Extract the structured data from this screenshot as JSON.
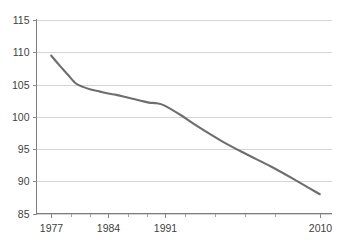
{
  "chart_data": {
    "type": "line",
    "title": "",
    "subtitle": "",
    "xlabel": "",
    "ylabel": "",
    "grid": "horizontal",
    "legend_position": "none",
    "xlim": [
      1975.2,
      2011.5
    ],
    "ylim": [
      85,
      115
    ],
    "y_ticks": [
      85,
      90,
      95,
      100,
      105,
      110,
      115
    ],
    "x_ticks": [
      1977,
      1984,
      1991,
      2010
    ],
    "x_tick_labels": [
      "1977",
      "1984",
      "1991",
      "2010"
    ],
    "x_minor_ticks": [
      1979.4,
      1981.8,
      1986.4,
      1988.8,
      1993.4,
      1997.1,
      2000.8,
      2004.5
    ],
    "series": [
      {
        "name": "index",
        "color": "#6e6e6e",
        "x": [
          1977,
          1978,
          1979,
          1980,
          1981,
          1982,
          1983,
          1984,
          1985,
          1986,
          1987,
          1988,
          1989,
          1990,
          1991,
          1993,
          1995,
          1998,
          2001,
          2004,
          2007,
          2010
        ],
        "values": [
          109.5,
          108.0,
          106.6,
          105.2,
          104.6,
          104.2,
          103.9,
          103.6,
          103.4,
          103.1,
          102.8,
          102.5,
          102.2,
          102.1,
          101.7,
          100.2,
          98.5,
          96.2,
          94.2,
          92.3,
          90.2,
          88.0
        ]
      }
    ],
    "annotations": []
  }
}
